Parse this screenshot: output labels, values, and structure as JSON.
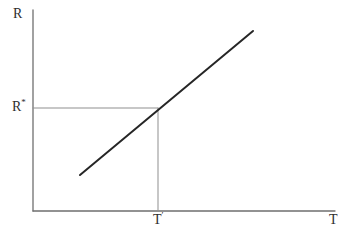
{
  "figure": {
    "background_color": "#ffffff",
    "labels": {
      "y_axis": "R",
      "y_marked_base": "R",
      "y_marked_sup": "*",
      "x_axis": "T",
      "x_marked_base": "T",
      "x_marked_sup": "′"
    }
  },
  "chart_data": {
    "type": "line",
    "title": "",
    "xlabel": "T",
    "ylabel": "R",
    "axes_numeric": false,
    "grid": false,
    "legend": false,
    "series": [
      {
        "name": "upward-sloping-line",
        "x_frac": [
          0.156,
          0.728
        ],
        "y_frac": [
          0.179,
          0.896
        ]
      }
    ],
    "marked_point": {
      "x_frac": 0.414,
      "y_frac": 0.512,
      "x_label": "T′",
      "y_label": "R*"
    },
    "colors": {
      "curve": "#262626",
      "axis": "#6f6f6f",
      "reference": "#8f8f8f",
      "text": "#2e2e2e"
    },
    "layout_px": {
      "width": 351,
      "height": 243,
      "origin_x": 33,
      "origin_y": 211,
      "axis_top_y": 10,
      "axis_right_x": 335,
      "curve_x1": 80,
      "curve_y1": 175,
      "curve_x2": 253,
      "curve_y2": 31,
      "ref_x": 158,
      "ref_y": 108,
      "axis_stroke_width": 1.3,
      "reference_stroke_width": 1,
      "curve_stroke_width": 2
    }
  }
}
